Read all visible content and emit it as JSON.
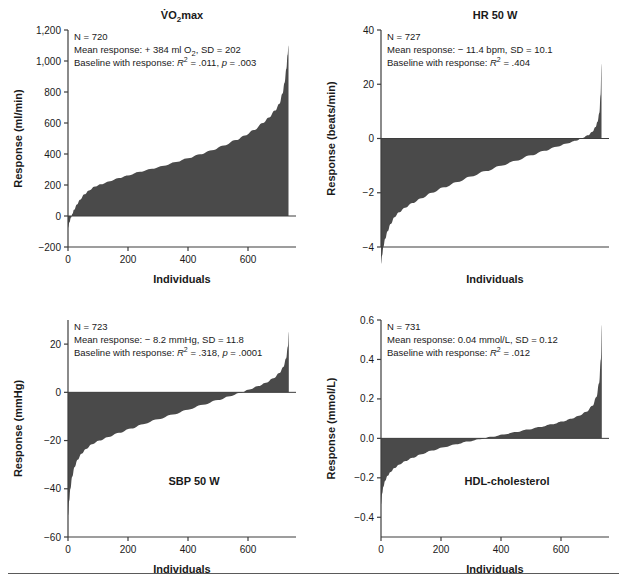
{
  "figure": {
    "background": "#ffffff",
    "fill_color": "#4a4a4a",
    "axis_color": "#3d3d3d",
    "footer_rule_color": "#5a5a5a"
  },
  "chart_data": [
    {
      "type": "area",
      "id": "vo2max",
      "title": "V̇O₂max",
      "title_parts": {
        "v_dot": "V̇",
        "o": "O",
        "sub": "2",
        "rest": "max"
      },
      "in_plot_label": "",
      "xlabel": "Individuals",
      "ylabel": "Response (ml/min)",
      "xlim": [
        0,
        760
      ],
      "ylim": [
        -200,
        1200
      ],
      "xticks": [
        0,
        200,
        400,
        600
      ],
      "xticklabels": [
        "0",
        "200",
        "400",
        "600"
      ],
      "yticks": [
        -200,
        0,
        200,
        400,
        600,
        800,
        1000,
        1200
      ],
      "yticklabels": [
        "−200",
        "0",
        "200",
        "400",
        "600",
        "800",
        "1,000",
        "1,200"
      ],
      "grid": false,
      "n": 720,
      "annotation": {
        "line1": "N = 720",
        "line2": "Mean response: + 384 ml O₂, SD = 202",
        "line3_prefix": "Baseline with response: ",
        "line3_r": "R",
        "line3_rsup": "2",
        "line3_rval": " = .011, ",
        "line3_p": "p",
        "line3_pval": " = .003"
      },
      "stats": {
        "mean_response": 384,
        "units": "ml O2",
        "sd": 202,
        "r_squared": 0.011,
        "p_value": 0.003
      },
      "x": [
        0,
        5,
        10,
        15,
        20,
        30,
        40,
        55,
        70,
        90,
        110,
        140,
        170,
        200,
        240,
        280,
        320,
        360,
        400,
        440,
        480,
        520,
        560,
        590,
        620,
        650,
        670,
        690,
        705,
        715,
        722,
        728,
        732,
        735
      ],
      "y": [
        -75,
        -40,
        -10,
        15,
        40,
        75,
        105,
        140,
        165,
        190,
        205,
        225,
        245,
        262,
        285,
        305,
        325,
        348,
        372,
        398,
        425,
        455,
        490,
        520,
        555,
        600,
        635,
        680,
        725,
        790,
        860,
        950,
        1040,
        1100
      ]
    },
    {
      "type": "area",
      "id": "hr50w",
      "title": "HR 50 W",
      "in_plot_label": "",
      "xlabel": "Individuals",
      "ylabel": "Response (beats/min)",
      "xlim": [
        0,
        760
      ],
      "yticks_positions": [
        0,
        1,
        2,
        3,
        4
      ],
      "yticklabels": [
        "−4",
        "−2",
        "0",
        "20",
        "40"
      ],
      "grid": false,
      "n": 727,
      "annotation": {
        "line1": "N = 727",
        "line2": "Mean response: − 11.4 bpm, SD = 10.1",
        "line3_prefix": "Baseline with response: ",
        "line3_r": "R",
        "line3_rsup": "2",
        "line3_rval": " = .404",
        "line3_p": "",
        "line3_pval": ""
      },
      "stats": {
        "mean_response": -11.4,
        "units": "bpm",
        "sd": 10.1,
        "r_squared": 0.404
      },
      "x": [
        0,
        4,
        8,
        14,
        22,
        32,
        45,
        60,
        80,
        105,
        135,
        170,
        210,
        255,
        300,
        350,
        400,
        450,
        500,
        545,
        585,
        620,
        650,
        672,
        690,
        705,
        715,
        722,
        728,
        732,
        735
      ],
      "y": [
        -4.62,
        -4.3,
        -4.0,
        -3.7,
        -3.42,
        -3.15,
        -2.9,
        -2.72,
        -2.55,
        -2.38,
        -2.2,
        -2.0,
        -1.8,
        -1.6,
        -1.4,
        -1.2,
        -1.0,
        -0.82,
        -0.62,
        -0.45,
        -0.3,
        -0.18,
        -0.08,
        0.02,
        0.12,
        0.25,
        0.42,
        0.62,
        0.95,
        1.6,
        2.75
      ]
    },
    {
      "type": "area",
      "id": "sbp50w",
      "title": "",
      "in_plot_label": "SBP 50 W",
      "xlabel": "Individuals",
      "ylabel": "Response (mmHg)",
      "xlim": [
        0,
        760
      ],
      "ylim": [
        -60,
        30
      ],
      "xticks": [
        0,
        200,
        400,
        600
      ],
      "xticklabels": [
        "0",
        "200",
        "400",
        "600"
      ],
      "yticks": [
        -60,
        -40,
        -20,
        0,
        20
      ],
      "yticklabels": [
        "−60",
        "−40",
        "−20",
        "0",
        "20"
      ],
      "grid": false,
      "n": 723,
      "annotation": {
        "line1": "N = 723",
        "line2": "Mean response: − 8.2 mmHg, SD = 11.8",
        "line3_prefix": "Baseline with response: ",
        "line3_r": "R",
        "line3_rsup": "2",
        "line3_rval": " = .318, ",
        "line3_p": "p",
        "line3_pval": " = .0001"
      },
      "stats": {
        "mean_response": -8.2,
        "units": "mmHg",
        "sd": 11.8,
        "r_squared": 0.318,
        "p_value": 0.0001
      },
      "x": [
        0,
        4,
        8,
        14,
        22,
        32,
        45,
        60,
        80,
        105,
        135,
        170,
        210,
        250,
        300,
        350,
        400,
        450,
        500,
        540,
        575,
        605,
        635,
        660,
        685,
        705,
        718,
        727,
        733,
        736
      ],
      "y": [
        -51,
        -45,
        -40,
        -35,
        -31,
        -28,
        -25.5,
        -23.5,
        -21.5,
        -20,
        -18.5,
        -16.8,
        -15,
        -13.2,
        -11.2,
        -9.2,
        -7.2,
        -5.2,
        -3.2,
        -1.6,
        -0.2,
        1.2,
        2.6,
        4.0,
        5.8,
        8.0,
        10.5,
        14.0,
        19.0,
        25.0
      ]
    },
    {
      "type": "area",
      "id": "hdl",
      "title": "",
      "in_plot_label": "HDL-cholesterol",
      "xlabel": "Individuals",
      "ylabel": "Response (mmol/L)",
      "xlim": [
        0,
        760
      ],
      "ylim": [
        -0.5,
        0.6
      ],
      "xticks": [
        0,
        200,
        400,
        600
      ],
      "xticklabels": [
        "0",
        "200",
        "400",
        "600"
      ],
      "yticks": [
        -0.4,
        -0.2,
        0.0,
        0.2,
        0.4,
        0.6
      ],
      "yticklabels": [
        "−0.4",
        "−0.2",
        "0.0",
        "0.2",
        "0.4",
        "0.6"
      ],
      "grid": false,
      "n": 731,
      "annotation": {
        "line1": "N = 731",
        "line2": "Mean response: 0.04 mmol/L, SD = 0.12",
        "line3_prefix": "Baseline with response: ",
        "line3_r": "R",
        "line3_rsup": "2",
        "line3_rval": " = .012",
        "line3_p": "",
        "line3_pval": ""
      },
      "stats": {
        "mean_response": 0.04,
        "units": "mmol/L",
        "sd": 0.12,
        "r_squared": 0.012
      },
      "x": [
        0,
        4,
        8,
        14,
        22,
        32,
        45,
        62,
        82,
        105,
        135,
        170,
        210,
        250,
        290,
        330,
        370,
        410,
        450,
        490,
        530,
        570,
        605,
        635,
        660,
        685,
        705,
        718,
        727,
        733,
        736
      ],
      "y": [
        -0.335,
        -0.28,
        -0.245,
        -0.215,
        -0.19,
        -0.17,
        -0.15,
        -0.132,
        -0.115,
        -0.098,
        -0.08,
        -0.062,
        -0.045,
        -0.03,
        -0.016,
        -0.004,
        0.008,
        0.02,
        0.032,
        0.045,
        0.058,
        0.072,
        0.086,
        0.1,
        0.115,
        0.135,
        0.165,
        0.21,
        0.28,
        0.4,
        0.575
      ]
    }
  ]
}
